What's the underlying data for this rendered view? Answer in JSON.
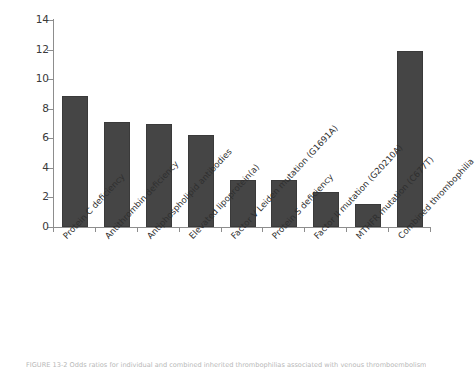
{
  "figure": {
    "caption": "FIGURE 13-2   Odds ratios for individual and combined inherited thrombophilias associated with venous thromboembolism.",
    "bar_color": "#454545",
    "axis_color": "#8d8d8d",
    "background": "#ffffff"
  },
  "chart_data": {
    "type": "bar",
    "title": "",
    "xlabel": "",
    "ylabel": "",
    "ylim": [
      0,
      14
    ],
    "yticks": [
      0,
      2,
      4,
      6,
      8,
      10,
      12,
      14
    ],
    "ytick_labels": [
      "0",
      "2",
      "4",
      "6",
      "8",
      "10",
      "12",
      "14"
    ],
    "grid": false,
    "legend": null,
    "categories": [
      "Protein C deficiency",
      "Antithrombin deficiency",
      "Antiphospholipid antibodies",
      "Elevated lipoprotein(a)",
      "Factor V Leiden mutation (G1691A)",
      "Protein S deficiency",
      "Factor II mutation (G20210A)",
      "MTHFR mutation (C677T)",
      "Combined thrombophilia"
    ],
    "values": [
      8.85,
      7.1,
      7.0,
      6.2,
      3.2,
      3.2,
      2.4,
      1.55,
      11.9
    ]
  }
}
